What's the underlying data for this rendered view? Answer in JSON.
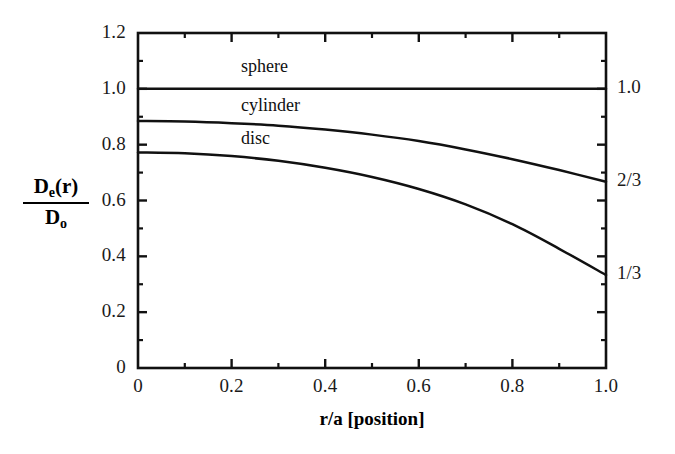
{
  "chart_data": {
    "type": "line",
    "title": "",
    "xlabel": "r/a [position]",
    "ylabel_numerator": "D",
    "ylabel_numerator_sub": "e",
    "ylabel_numerator_tail": "(r)",
    "ylabel_denominator": "D",
    "ylabel_denominator_sub": "o",
    "xlim": [
      0,
      1.0
    ],
    "ylim": [
      0,
      1.2
    ],
    "xticks": [
      0,
      0.2,
      0.4,
      0.6,
      0.8,
      1.0
    ],
    "xtick_labels": [
      "0",
      "0.2",
      "0.4",
      "0.6",
      "0.8",
      "1.0"
    ],
    "xminor_ticks": [
      0.1,
      0.3,
      0.5,
      0.7,
      0.9
    ],
    "yticks": [
      0,
      0.2,
      0.4,
      0.6,
      0.8,
      1.0,
      1.2
    ],
    "ytick_labels": [
      "0",
      "0.2",
      "0.4",
      "0.6",
      "0.8",
      "1.0",
      "1.2"
    ],
    "yminor_ticks": [
      0.1,
      0.3,
      0.5,
      0.7,
      0.9,
      1.1
    ],
    "grid": false,
    "legend_position": "inline-annotations",
    "right_axis_labels": [
      {
        "value": 1.0,
        "text": "1.0"
      },
      {
        "value": 0.6667,
        "text": "2/3"
      },
      {
        "value": 0.3333,
        "text": "1/3"
      }
    ],
    "series": [
      {
        "name": "sphere",
        "label": "sphere",
        "label_x": 0.22,
        "label_y": 1.075,
        "x": [
          0.0,
          0.1,
          0.2,
          0.3,
          0.4,
          0.5,
          0.6,
          0.7,
          0.8,
          0.9,
          1.0
        ],
        "values": [
          1.0,
          1.0,
          1.0,
          1.0,
          1.0,
          1.0,
          1.0,
          1.0,
          1.0,
          1.0,
          1.0
        ]
      },
      {
        "name": "cylinder",
        "label": "cylinder",
        "label_x": 0.22,
        "label_y": 0.935,
        "x": [
          0.0,
          0.1,
          0.2,
          0.3,
          0.4,
          0.5,
          0.6,
          0.7,
          0.8,
          0.9,
          1.0
        ],
        "values": [
          0.885,
          0.883,
          0.877,
          0.868,
          0.854,
          0.836,
          0.813,
          0.783,
          0.748,
          0.709,
          0.667
        ]
      },
      {
        "name": "disc",
        "label": "disc",
        "label_x": 0.22,
        "label_y": 0.815,
        "x": [
          0.0,
          0.1,
          0.2,
          0.3,
          0.4,
          0.5,
          0.6,
          0.7,
          0.8,
          0.9,
          1.0
        ],
        "values": [
          0.772,
          0.769,
          0.759,
          0.742,
          0.717,
          0.684,
          0.641,
          0.586,
          0.515,
          0.427,
          0.333
        ]
      }
    ]
  },
  "axes": {
    "y_tick_labels": [
      "1.2",
      "1.0",
      "0.8",
      "0.6",
      "0.4",
      "0.2",
      "0"
    ],
    "x_tick_labels": [
      "0",
      "0.2",
      "0.4",
      "0.6",
      "0.8",
      "1.0"
    ],
    "right_labels": [
      "1.0",
      "2/3",
      "1/3"
    ],
    "x_axis_title": "r/a [position]"
  },
  "curve_labels": {
    "sphere": "sphere",
    "cylinder": "cylinder",
    "disc": "disc"
  },
  "colors": {
    "line": "#111111",
    "axis": "#111111",
    "background": "#ffffff"
  }
}
